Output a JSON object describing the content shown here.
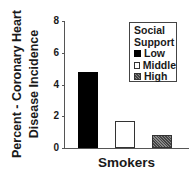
{
  "chart_data": {
    "type": "bar",
    "title": "",
    "xlabel": "Smokers",
    "ylabel": "Percent - Coronary Heart Disease Incidence",
    "ylabel_lines": [
      "Percent - Coronary Heart",
      "Disease Incidence"
    ],
    "ylim": [
      0,
      8
    ],
    "yticks": [
      0,
      2,
      4,
      6,
      8
    ],
    "categories": [
      "Smokers"
    ],
    "series": [
      {
        "name": "Low",
        "values": [
          4.8
        ],
        "color": "#000000"
      },
      {
        "name": "Middle",
        "values": [
          1.7
        ],
        "color": "#ffffff"
      },
      {
        "name": "High",
        "values": [
          0.8
        ],
        "color": "#666666"
      }
    ],
    "legend": {
      "title_lines": [
        "Social",
        "Support"
      ],
      "entries": [
        "Low",
        "Middle",
        "High"
      ],
      "position": "upper right"
    },
    "grid": false
  },
  "yticks_text": [
    "0",
    "2",
    "4",
    "6",
    "8"
  ]
}
